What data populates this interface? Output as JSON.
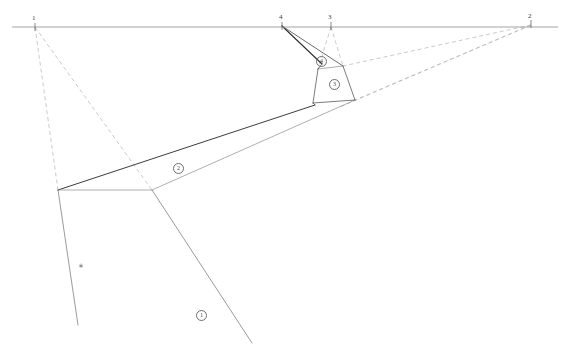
{
  "drawing": {
    "title": "Two-point perspective construction with measuring points",
    "canvas": {
      "width": 570,
      "height": 356,
      "background": "#ffffff"
    },
    "colors": {
      "horizon": "#9a9a9a",
      "solid_edge": "#3c3c3c",
      "light_edge": "#8c8c8c",
      "dashed_construction": "#b8b8b8",
      "label_text": "#3a3a3a",
      "region_text": "#555555"
    },
    "horizon_line": {
      "label": "horizon-line",
      "y": 27,
      "x_start": 12,
      "x_end": 558
    },
    "vanishing_points": [
      {
        "id": "vp1",
        "label": "1",
        "x": 35,
        "y": 27,
        "label_x": 32,
        "label_y": 15
      },
      {
        "id": "vp4",
        "label": "4",
        "x": 282,
        "y": 26,
        "label_x": 279,
        "label_y": 14
      },
      {
        "id": "vp3",
        "label": "3",
        "x": 331,
        "y": 26,
        "label_x": 328,
        "label_y": 14
      },
      {
        "id": "vp2",
        "label": "2",
        "x": 531,
        "y": 24,
        "label_x": 528,
        "label_y": 13
      }
    ],
    "region_labels": [
      {
        "id": "region-1",
        "number": "1",
        "x": 196,
        "y": 310
      },
      {
        "id": "region-2",
        "number": "2",
        "x": 173,
        "y": 163
      },
      {
        "id": "region-3",
        "number": "3",
        "x": 329,
        "y": 79
      },
      {
        "id": "region-4",
        "number": "4",
        "x": 316,
        "y": 56
      }
    ],
    "point_marks": [
      {
        "id": "mark-a",
        "glyph": "∗",
        "x": 78,
        "y": 263
      }
    ],
    "solid_paths": [
      {
        "name": "band-upper-edge",
        "points": "58,190 315,105",
        "weight": 1.0,
        "color": "#3c3c3c"
      },
      {
        "name": "band-lower-edge",
        "points": "152,190 355,100",
        "weight": 0.7,
        "color": "#8c8c8c"
      },
      {
        "name": "band-left-end",
        "points": "58,190 152,190",
        "weight": 0.7,
        "color": "#8c8c8c"
      },
      {
        "name": "trapezoid-top-edge",
        "points": "318,69 343,66",
        "weight": 0.7,
        "color": "#8c8c8c"
      },
      {
        "name": "trapezoid-left-edge",
        "points": "318,69 313,103",
        "weight": 0.8,
        "color": "#5a5a5a"
      },
      {
        "name": "trapezoid-right-edge",
        "points": "343,66 355,100",
        "weight": 0.8,
        "color": "#5a5a5a"
      },
      {
        "name": "trapezoid-bottom-edge",
        "points": "313,103 355,100",
        "weight": 0.8,
        "color": "#5a5a5a"
      },
      {
        "name": "apex-left-ray",
        "points": "282,26 322,64",
        "weight": 1.1,
        "color": "#2e2e2e"
      },
      {
        "name": "apex-right-ray",
        "points": "282,26 343,66",
        "weight": 0.9,
        "color": "#5a5a5a"
      },
      {
        "name": "apex-to-trapezoid",
        "points": "322,64 318,69",
        "weight": 0.8,
        "color": "#5a5a5a"
      },
      {
        "name": "ground-left-leg",
        "points": "58,190 78,325",
        "weight": 0.7,
        "color": "#6e6e6e"
      },
      {
        "name": "ground-right-leg",
        "points": "152,190 252,343",
        "weight": 0.7,
        "color": "#6e6e6e"
      },
      {
        "name": "band-right-cap",
        "points": "315,105 313,103",
        "weight": 0.8,
        "color": "#5a5a5a"
      }
    ],
    "dashed_paths": [
      {
        "name": "vp1-to-band-left",
        "points": "35,27 58,190"
      },
      {
        "name": "vp1-to-band-mid",
        "points": "35,27 152,190"
      },
      {
        "name": "vp3-to-trapezoid-left",
        "points": "331,27 318,69"
      },
      {
        "name": "vp3-to-trapezoid-right",
        "points": "331,27 343,66"
      },
      {
        "name": "vp2-to-trapezoid-right-top",
        "points": "531,25 343,66"
      },
      {
        "name": "vp2-to-trapezoid-right-bottom",
        "points": "531,25 355,100"
      },
      {
        "name": "vp2-lower-ray",
        "points": "531,25 340,107"
      }
    ]
  }
}
